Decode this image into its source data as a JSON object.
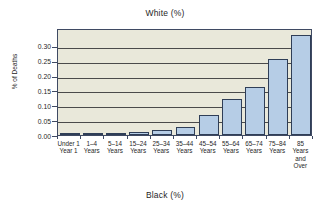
{
  "chart_data": {
    "type": "bar",
    "title": "White (%)",
    "subtitle": "Black (%)",
    "xlabel": "",
    "ylabel": "% of Deaths",
    "ylim": [
      0.0,
      0.36
    ],
    "grid": true,
    "legend": "none",
    "ytick_labels": [
      "0.30",
      "0.25",
      "0.20",
      "0.15",
      "0.10",
      "0.05",
      "0.00"
    ],
    "ytick_values": [
      0.3,
      0.25,
      0.2,
      0.15,
      0.1,
      0.05,
      0.0
    ],
    "categories": [
      "Under 1\nYear 1",
      "1–4\nYears",
      "5–14\nYears",
      "15–24\nYears",
      "25–34\nYears",
      "35–44\nYears",
      "45–54\nYears",
      "55–64\nYears",
      "65–74\nYears",
      "75–84\nYears",
      "85\nYears\nand\nOver"
    ],
    "values": [
      0.008,
      0.003,
      0.005,
      0.011,
      0.017,
      0.027,
      0.068,
      0.121,
      0.163,
      0.257,
      0.335
    ],
    "colors": {
      "bar_fill": "#b6cde6",
      "bar_edge": "#2f3e57",
      "plot_background": "#e9e8da",
      "gridline": "#4a4a4a",
      "axis": "#3f4a63",
      "text": "#1f1f1f",
      "page_background": "#ffffff"
    }
  }
}
